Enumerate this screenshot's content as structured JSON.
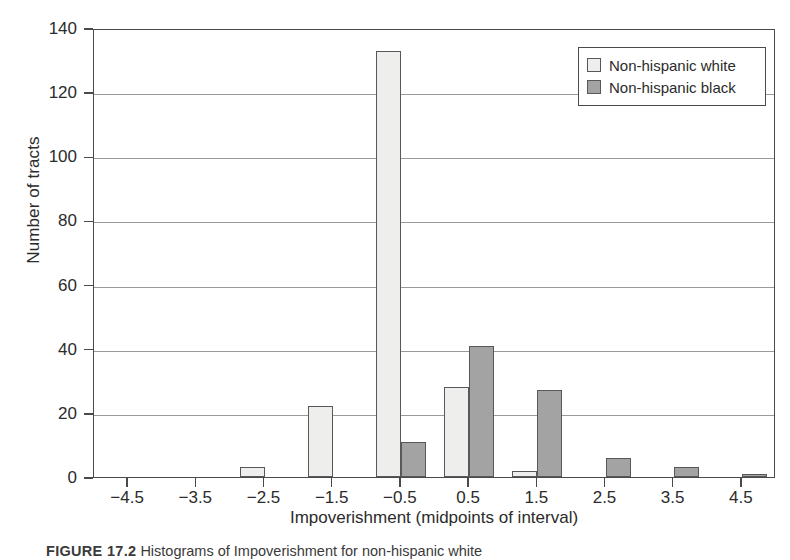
{
  "chart_data": {
    "type": "bar",
    "title": "",
    "xlabel": "Impoverishment (midpoints of interval)",
    "ylabel": "Number of tracts",
    "categories": [
      "-4.5",
      "-3.5",
      "-2.5",
      "-1.5",
      "-0.5",
      "0.5",
      "1.5",
      "2.5",
      "3.5",
      "4.5"
    ],
    "series": [
      {
        "name": "Non-hispanic white",
        "color": "#eeeeec",
        "values": [
          0,
          0,
          3,
          22,
          133,
          28,
          2,
          0,
          0,
          0
        ]
      },
      {
        "name": "Non-hispanic black",
        "color": "#a3a3a3",
        "values": [
          0,
          0,
          0,
          0,
          11,
          41,
          27,
          6,
          3,
          1
        ]
      }
    ],
    "ylim": [
      0,
      140
    ],
    "yticks": [
      0,
      20,
      40,
      60,
      80,
      100,
      120,
      140
    ],
    "ytick_labels": [
      "0",
      "20",
      "40",
      "60",
      "80",
      "100",
      "120",
      "140"
    ],
    "xlim": [
      -5.0,
      5.0
    ],
    "grid": true,
    "grid_axis": "y",
    "legend_position": "top-right"
  },
  "legend": {
    "entries": [
      {
        "label": "Non-hispanic white",
        "swatch": "light"
      },
      {
        "label": "Non-hispanic black",
        "swatch": "dark"
      }
    ]
  },
  "caption": {
    "label": "FIGURE 17.2",
    "text": "Histograms of Impoverishment for non-hispanic white"
  }
}
